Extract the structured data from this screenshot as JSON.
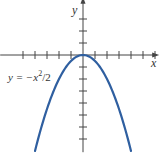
{
  "chart_data": {
    "type": "line",
    "title": "",
    "xlabel": "x",
    "ylabel": "y",
    "annotations": [
      {
        "text": "y = -x²/2",
        "x": -4.6,
        "y": -1.8
      }
    ],
    "function": "y = -x^2/2",
    "series": [
      {
        "name": "y = -x^2/2",
        "color": "#2f5fa0",
        "x": [
          -4,
          -3.5,
          -3,
          -2.5,
          -2,
          -1.5,
          -1,
          -0.5,
          0,
          0.5,
          1,
          1.5,
          2,
          2.5,
          3,
          3.5,
          4
        ],
        "y": [
          -8,
          -6.125,
          -4.5,
          -3.125,
          -2,
          -1.125,
          -0.5,
          -0.125,
          0,
          -0.125,
          -0.5,
          -1.125,
          -2,
          -3.125,
          -4.5,
          -6.125,
          -8
        ]
      }
    ],
    "xlim": [
      -6.9,
      6.1
    ],
    "ylim": [
      -8.1,
      4.6
    ],
    "x_ticks": [
      -5,
      -4,
      -3,
      -2,
      -1,
      1,
      2,
      3,
      4,
      5,
      6
    ],
    "y_ticks": [
      3,
      2,
      1,
      -1,
      -2,
      -3,
      -4,
      -5,
      -6,
      -7
    ],
    "grid": false,
    "legend": "none",
    "axis_color": "#444444",
    "scale_px_per_unit": 12,
    "origin_px": [
      83,
      55
    ]
  },
  "labels": {
    "x_axis": "x",
    "y_axis": "y",
    "equation_prefix": "y = −x",
    "equation_exp": "2",
    "equation_suffix": "/2"
  }
}
